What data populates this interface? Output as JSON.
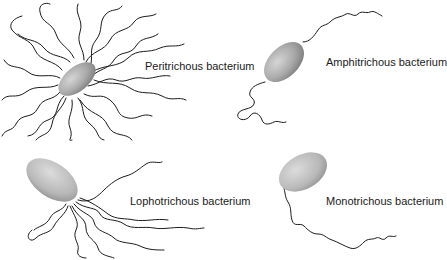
{
  "diagram": {
    "panels": [
      {
        "id": "peritrichous",
        "label": "Peritrichous bacterium",
        "description": "Flagella distributed over entire cell surface"
      },
      {
        "id": "amphitrichous",
        "label": "Amphitrichous bacterium",
        "description": "Single flagellum at each end"
      },
      {
        "id": "lophotrichous",
        "label": "Lophotrichous bacterium",
        "description": "Tuft of flagella at one end"
      },
      {
        "id": "monotrichous",
        "label": "Monotrichous bacterium",
        "description": "Single flagellum at one end"
      }
    ]
  },
  "colors": {
    "cell_light": "#c8c8c8",
    "cell_dark": "#8a8a8a",
    "flagellum": "#1c1c1c",
    "background": "#ffffff"
  }
}
